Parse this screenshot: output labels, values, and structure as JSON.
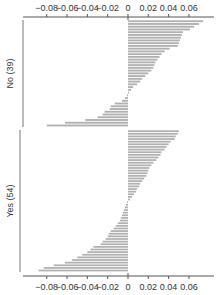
{
  "chart_data": {
    "type": "bar",
    "orientation": "horizontal",
    "title": "",
    "xlabel": "",
    "ylabel": "",
    "xlim": [
      -0.095,
      0.075
    ],
    "xticks": [
      -0.08,
      -0.06,
      -0.04,
      -0.02,
      0,
      0.02,
      0.04,
      0.06
    ],
    "xtick_labels": [
      "−0.08",
      "−0.06",
      "−0.04",
      "−0.02",
      "0",
      "0.02",
      "0.04",
      "0.06"
    ],
    "axes_top": true,
    "axes_bottom": true,
    "grid": false,
    "bar_color": "#b0b0b0",
    "groups": [
      {
        "name": "No (39)",
        "count": 39,
        "values": [
          0.074,
          0.07,
          0.065,
          0.061,
          0.054,
          0.053,
          0.052,
          0.051,
          0.05,
          0.049,
          0.041,
          0.036,
          0.033,
          0.031,
          0.029,
          0.027,
          0.026,
          0.025,
          0.023,
          0.02,
          0.017,
          0.014,
          0.012,
          0.009,
          0.005,
          0.003,
          0.001,
          -0.001,
          -0.003,
          -0.006,
          -0.013,
          -0.017,
          -0.018,
          -0.023,
          -0.025,
          -0.03,
          -0.042,
          -0.062,
          -0.08
        ]
      },
      {
        "name": "Yes (54)",
        "count": 54,
        "values": [
          0.05,
          0.049,
          0.047,
          0.046,
          0.042,
          0.04,
          0.038,
          0.036,
          0.033,
          0.032,
          0.03,
          0.028,
          0.025,
          0.023,
          0.021,
          0.02,
          0.019,
          0.018,
          0.016,
          0.014,
          0.012,
          0.011,
          0.009,
          0.008,
          0.006,
          0.004,
          0.002,
          -0.001,
          -0.002,
          -0.003,
          -0.004,
          -0.005,
          -0.006,
          -0.007,
          -0.008,
          -0.01,
          -0.012,
          -0.014,
          -0.017,
          -0.019,
          -0.02,
          -0.022,
          -0.025,
          -0.027,
          -0.034,
          -0.037,
          -0.04,
          -0.045,
          -0.05,
          -0.055,
          -0.062,
          -0.073,
          -0.083,
          -0.088
        ]
      }
    ]
  },
  "layout": {
    "zero_x": 128,
    "px_per_unit": 1016,
    "plot_left": 23,
    "plot_right": 214,
    "top_axis_y": 17,
    "bottom_axis_y": 276,
    "groups": [
      {
        "y_start": 20,
        "y_end": 127,
        "frame_left": 23
      },
      {
        "y_start": 130,
        "y_end": 272,
        "frame_left": 20
      }
    ]
  }
}
